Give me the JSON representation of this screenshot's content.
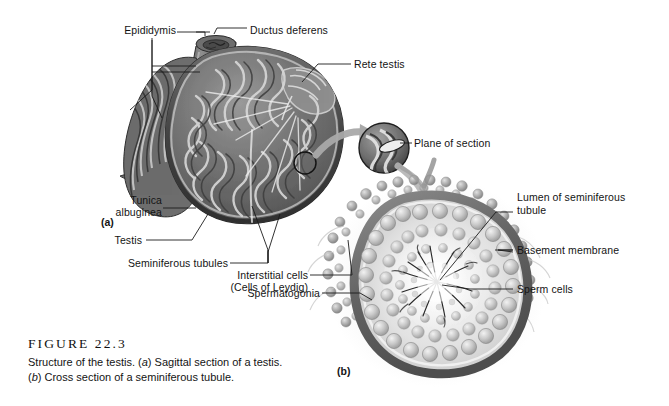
{
  "figure": {
    "number": "FIGURE 22.3",
    "caption_line1_a": "Structure of the testis. (",
    "caption_line1_ital": "a",
    "caption_line1_b": ") Sagittal section of a testis.",
    "caption_line2_ital": "b",
    "caption_line2_a": "(",
    "caption_line2_b": ") Cross section of a seminiferous tubule."
  },
  "panels": {
    "a_letter": "(a)",
    "b_letter": "(b)"
  },
  "labels": {
    "epididymis": "Epididymis",
    "ductus_deferens": "Ductus deferens",
    "rete_testis": "Rete testis",
    "tunica_albuginea_l1": "Tunica",
    "tunica_albuginea_l2": "albuginea",
    "testis": "Testis",
    "seminiferous_tubules": "Seminiferous tubules",
    "interstitial_cells_l1": "Interstitial cells",
    "interstitial_cells_l2": "(Cells of Leydig)",
    "spermatogonia": "Spermatogonia",
    "plane_of_section": "Plane of section",
    "lumen_l1": "Lumen of seminiferous",
    "lumen_l2": "tubule",
    "basement_membrane": "Basement membrane",
    "sperm_cells": "Sperm cells"
  },
  "colors": {
    "background": "#ffffff",
    "ink": "#141414",
    "leader_line": "#1b1b1b",
    "tissue_dark": "#4a4a4a",
    "tissue_mid": "#7d7d7d",
    "tissue_light": "#b9b9b9",
    "tissue_pale": "#dcdcdc",
    "arrow_gray": "#a9a9a9"
  }
}
